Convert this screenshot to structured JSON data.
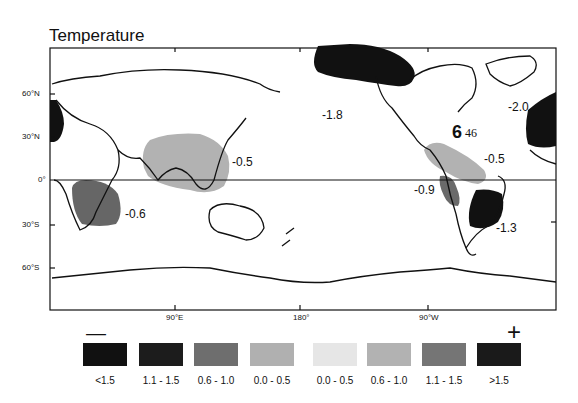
{
  "title": "Temperature",
  "axes": {
    "y_ticks": [
      "60°N",
      "30°N",
      "0°",
      "30°S",
      "60°S"
    ],
    "x_ticks": [
      "90°E",
      "180°",
      "90°W"
    ]
  },
  "anomalies": [
    {
      "label": "-1.8",
      "region": "North Pacific / Alaska"
    },
    {
      "label": "-2.0",
      "region": "North Atlantic"
    },
    {
      "label": "-0.5",
      "region": "South / Southeast Asia"
    },
    {
      "label": "-0.6",
      "region": "Southern Africa"
    },
    {
      "label": "-0.5",
      "region": "Central America / Caribbean"
    },
    {
      "label": "-0.9",
      "region": "Western South America"
    },
    {
      "label": "-1.3",
      "region": "Eastern South America"
    }
  ],
  "marker": {
    "symbol": "6",
    "label": "46"
  },
  "legend": {
    "minus": "—",
    "plus": "+",
    "items": [
      {
        "label": "<1.5",
        "color": "#111111"
      },
      {
        "label": "1.1 - 1.5",
        "color": "#1c1c1c"
      },
      {
        "label": "0.6 - 1.0",
        "color": "#6e6e6e"
      },
      {
        "label": "0.0 - 0.5",
        "color": "#b0b0b0"
      },
      {
        "label": "0.0 - 0.5",
        "color": "#e6e6e6"
      },
      {
        "label": "0.6 - 1.0",
        "color": "#b2b2b2"
      },
      {
        "label": "1.1 - 1.5",
        "color": "#757575"
      },
      {
        "label": ">1.5",
        "color": "#1a1a1a"
      }
    ]
  }
}
